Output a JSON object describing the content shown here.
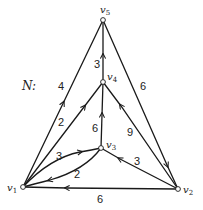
{
  "network": {
    "name": "N:",
    "nodes": [
      {
        "id": "v1",
        "label": "v",
        "sub": "1",
        "x": 23,
        "y": 187
      },
      {
        "id": "v2",
        "label": "v",
        "sub": "2",
        "x": 178,
        "y": 189
      },
      {
        "id": "v3",
        "label": "v",
        "sub": "3",
        "x": 101,
        "y": 148
      },
      {
        "id": "v4",
        "label": "v",
        "sub": "4",
        "x": 103,
        "y": 82
      },
      {
        "id": "v5",
        "label": "v",
        "sub": "5",
        "x": 103,
        "y": 20
      }
    ],
    "edges": [
      {
        "from": "v1",
        "to": "v5",
        "weight": "4"
      },
      {
        "from": "v5",
        "to": "v2",
        "weight": "6"
      },
      {
        "from": "v4",
        "to": "v5",
        "weight": "3"
      },
      {
        "from": "v1",
        "to": "v4",
        "weight": "2"
      },
      {
        "from": "v3",
        "to": "v4",
        "weight": "6"
      },
      {
        "from": "v2",
        "to": "v4",
        "weight": "9"
      },
      {
        "from": "v1",
        "to": "v3",
        "weight": "3"
      },
      {
        "from": "v3",
        "to": "v1",
        "weight": "2"
      },
      {
        "from": "v2",
        "to": "v3",
        "weight": "3"
      },
      {
        "from": "v2",
        "to": "v1",
        "weight": "6"
      }
    ]
  }
}
